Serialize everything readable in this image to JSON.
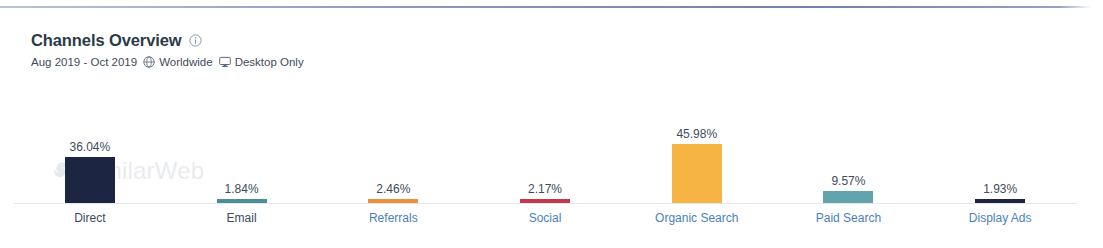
{
  "card": {
    "title": "Channels Overview",
    "info_icon": "info-circle-icon",
    "subtitle": {
      "date_range": "Aug 2019 - Oct 2019",
      "globe_icon": "globe-icon",
      "region": "Worldwide",
      "device_icon": "desktop-monitor-icon",
      "device": "Desktop Only"
    },
    "watermark": {
      "text": "SimilarWeb",
      "logo_icon": "similarweb-logo-icon"
    }
  },
  "colors": {
    "title": "#2b3a4a",
    "subtitle": "#3d4b5c",
    "link": "#4a7fc1",
    "baseline": "#e4e8ed",
    "top_rule": "#8c9cba"
  },
  "chart_data": {
    "type": "bar",
    "title": "Channels Overview",
    "subtitle": "Aug 2019 - Oct 2019 Worldwide Desktop Only",
    "xlabel": "",
    "ylabel": "",
    "ylim": [
      0,
      46
    ],
    "grid": false,
    "legend": "none",
    "unit": "%",
    "categories": [
      "Direct",
      "Email",
      "Referrals",
      "Social",
      "Organic Search",
      "Paid Search",
      "Display Ads"
    ],
    "values": [
      36.04,
      1.84,
      2.46,
      2.17,
      45.98,
      9.57,
      1.93
    ],
    "value_labels": [
      "36.04%",
      "1.84%",
      "2.46%",
      "2.17%",
      "45.98%",
      "9.57%",
      "1.93%"
    ],
    "bar_colors": [
      "#1c2541",
      "#4a8f96",
      "#ef8f3d",
      "#c4394a",
      "#f6b445",
      "#62a4ae",
      "#1c2541"
    ],
    "label_is_link": [
      false,
      false,
      true,
      true,
      true,
      true,
      true
    ],
    "bars": [
      {
        "category": "Direct",
        "value": 36.04,
        "label": "36.04%",
        "color": "#1c2541",
        "link": false
      },
      {
        "category": "Email",
        "value": 1.84,
        "label": "1.84%",
        "color": "#4a8f96",
        "link": false
      },
      {
        "category": "Referrals",
        "value": 2.46,
        "label": "2.46%",
        "color": "#ef8f3d",
        "link": true
      },
      {
        "category": "Social",
        "value": 2.17,
        "label": "2.17%",
        "color": "#c4394a",
        "link": true
      },
      {
        "category": "Organic Search",
        "value": 45.98,
        "label": "45.98%",
        "color": "#f6b445",
        "link": true
      },
      {
        "category": "Paid Search",
        "value": 9.57,
        "label": "9.57%",
        "color": "#62a4ae",
        "link": true
      },
      {
        "category": "Display Ads",
        "value": 1.93,
        "label": "1.93%",
        "color": "#1c2541",
        "link": true
      }
    ]
  }
}
